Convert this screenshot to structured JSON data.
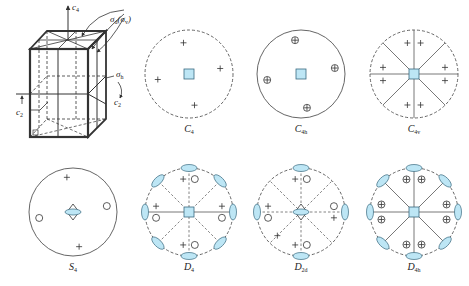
{
  "figure": {
    "crystal": {
      "labels": {
        "c4": "c",
        "c4_sub": "4",
        "sigma_d": "σ",
        "sigma_d_sub": "d",
        "sigma_v_paren_open": "(σ",
        "sigma_v_sub": "v",
        "sigma_v_paren_close": ")",
        "sigma_h": "σ",
        "sigma_h_sub": "h",
        "c2_right": "c",
        "c2_right_sub": "2",
        "c2_left": "c",
        "c2_left_sub": "2"
      }
    },
    "colors": {
      "symmetry_fill": "#bde6f5",
      "symmetry_stroke": "#3a6a80",
      "line": "#555555",
      "dashed": "#666666"
    },
    "stereograms": [
      {
        "id": "C4",
        "name": "C",
        "sub": "4",
        "circle": "dashed"
      },
      {
        "id": "C4h",
        "name": "C",
        "sub": "4h",
        "circle": "solid"
      },
      {
        "id": "C4v",
        "name": "C",
        "sub": "4v",
        "circle": "dashed"
      },
      {
        "id": "S4",
        "name": "S",
        "sub": "4",
        "circle": "solid"
      },
      {
        "id": "D4",
        "name": "D",
        "sub": "4",
        "circle": "dashed"
      },
      {
        "id": "D2d",
        "name": "D",
        "sub": "2d",
        "circle": "dashed"
      },
      {
        "id": "D4h",
        "name": "D",
        "sub": "4h",
        "circle": "dashed"
      }
    ]
  }
}
